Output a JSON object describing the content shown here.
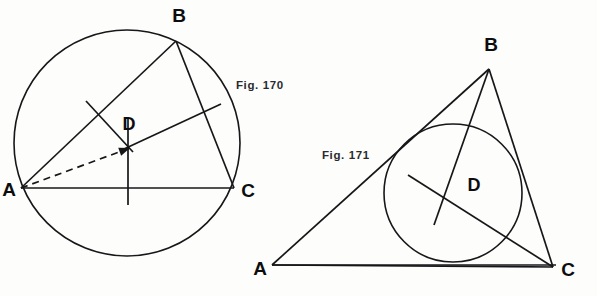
{
  "page": {
    "width": 597,
    "height": 296,
    "background": "#fdfdfb",
    "ink_color": "#17171a"
  },
  "figures": [
    {
      "id": "fig-170",
      "caption": "Fig. 170",
      "caption_pos": {
        "x": 236,
        "y": 89
      },
      "description": "Triangle ABC inscribed in a circle with circumcenter D located by perpendicular bisectors of the sides",
      "circle": {
        "name": "circumcircle",
        "cx": 127,
        "cy": 143,
        "r": 113
      },
      "vertices": [
        {
          "label": "A",
          "x": 21,
          "y": 188,
          "label_x": 9,
          "label_y": 196
        },
        {
          "label": "B",
          "x": 176,
          "y": 41,
          "label_x": 179,
          "label_y": 22
        },
        {
          "label": "C",
          "x": 234,
          "y": 188,
          "label_x": 248,
          "label_y": 197
        }
      ],
      "center": {
        "label": "D",
        "x": 128,
        "y": 146,
        "label_x": 129,
        "label_y": 130
      },
      "sides": [
        {
          "name": "side-AB",
          "x1": 21,
          "y1": 188,
          "x2": 176,
          "y2": 41
        },
        {
          "name": "side-BC",
          "x1": 176,
          "y1": 41,
          "x2": 234,
          "y2": 188
        },
        {
          "name": "side-AC",
          "x1": 21,
          "y1": 188,
          "x2": 234,
          "y2": 188
        }
      ],
      "bisectors": [
        {
          "name": "perpendicular-bisector-AB",
          "x1": 86,
          "y1": 101,
          "x2": 133,
          "y2": 152
        },
        {
          "name": "perpendicular-bisector-BC",
          "x1": 124,
          "y1": 149,
          "x2": 221,
          "y2": 104
        },
        {
          "name": "perpendicular-bisector-AC",
          "x1": 128,
          "y1": 118,
          "x2": 128,
          "y2": 205
        }
      ],
      "radius_line": {
        "name": "radius-DA-dashed",
        "x1": 21,
        "y1": 188,
        "x2": 130,
        "y2": 148,
        "style": "dashed",
        "arrow": true
      }
    },
    {
      "id": "fig-171",
      "caption": "Fig. 171",
      "caption_pos": {
        "x": 322,
        "y": 159
      },
      "description": "Triangle ABC with inscribed circle and incenter D located by the angle bisectors",
      "circle": {
        "name": "incircle",
        "cx": 453,
        "cy": 193,
        "r": 69
      },
      "vertices": [
        {
          "label": "A",
          "x": 272,
          "y": 265,
          "label_x": 260,
          "label_y": 275
        },
        {
          "label": "B",
          "x": 489,
          "y": 69,
          "label_x": 491,
          "label_y": 51
        },
        {
          "label": "C",
          "x": 553,
          "y": 267,
          "label_x": 568,
          "label_y": 276
        }
      ],
      "center": {
        "label": "D",
        "x": 453,
        "y": 193,
        "label_x": 474,
        "label_y": 191
      },
      "sides": [
        {
          "name": "side-AB",
          "x1": 272,
          "y1": 265,
          "x2": 489,
          "y2": 69
        },
        {
          "name": "side-BC",
          "x1": 489,
          "y1": 69,
          "x2": 553,
          "y2": 267
        },
        {
          "name": "side-AC",
          "x1": 272,
          "y1": 265,
          "x2": 553,
          "y2": 267
        }
      ],
      "bisectors": [
        {
          "name": "angle-bisector-from-A",
          "x1": 272,
          "y1": 265,
          "x2": 556,
          "y2": 265
        },
        {
          "name": "angle-bisector-from-B",
          "x1": 489,
          "y1": 69,
          "x2": 434,
          "y2": 225
        },
        {
          "name": "angle-bisector-from-C",
          "x1": 553,
          "y1": 267,
          "x2": 408,
          "y2": 175
        }
      ]
    }
  ]
}
